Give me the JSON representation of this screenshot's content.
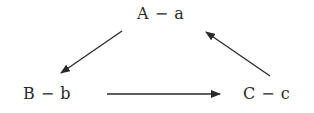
{
  "diagram": {
    "type": "cycle",
    "nodes": [
      {
        "id": "A",
        "label": "A − a"
      },
      {
        "id": "B",
        "label": "B − b"
      },
      {
        "id": "C",
        "label": "C − c"
      }
    ],
    "edges": [
      {
        "from": "A",
        "to": "B"
      },
      {
        "from": "B",
        "to": "C"
      },
      {
        "from": "C",
        "to": "A"
      }
    ],
    "colors": {
      "stroke": "#2a2a2a",
      "text": "#2a2a2a",
      "background": "#ffffff"
    }
  }
}
